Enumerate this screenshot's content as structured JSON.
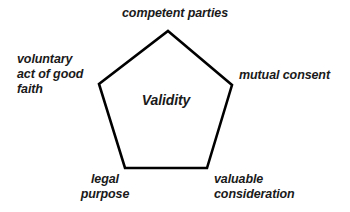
{
  "diagram": {
    "type": "pentagon-concept-diagram",
    "shape": {
      "name": "pentagon",
      "sides": 5,
      "stroke_color": "#000000",
      "fill_color": "#ffffff",
      "stroke_width": 2.6,
      "vertices": [
        {
          "x": 168,
          "y": 31,
          "position": "top"
        },
        {
          "x": 232,
          "y": 85,
          "position": "right"
        },
        {
          "x": 207,
          "y": 168,
          "position": "bottom-right"
        },
        {
          "x": 125,
          "y": 168,
          "position": "bottom-left"
        },
        {
          "x": 99,
          "y": 84,
          "position": "left"
        }
      ]
    },
    "background_color": "#ffffff",
    "text_color": "#1a1a1a",
    "center_label": "Validity",
    "labels": {
      "top": "competent parties",
      "left": "voluntary\nact of good\nfaith",
      "right": "mutual consent",
      "bottom_left": "legal\npurpose",
      "bottom_right": "valuable\nconsideration"
    }
  }
}
